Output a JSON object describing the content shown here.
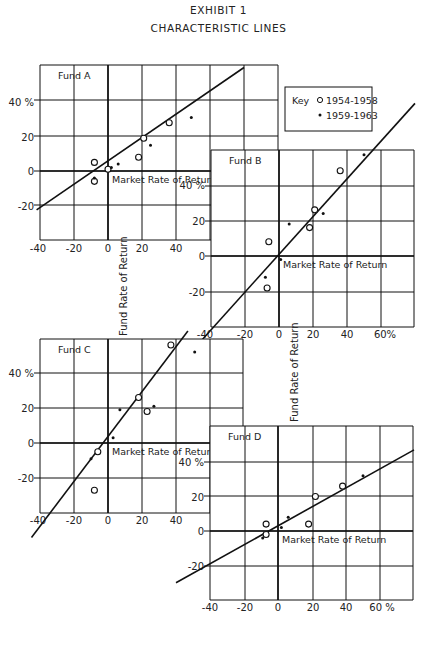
{
  "header": {
    "title": "EXHIBIT 1",
    "subtitle": "CHARACTERISTIC LINES"
  },
  "key": {
    "label": "Key",
    "entries": [
      {
        "marker": "open-circle",
        "label": "1954-1958"
      },
      {
        "marker": "dot",
        "label": "1959-1963"
      }
    ]
  },
  "axis_labels": {
    "x": "Market Rate of Return",
    "y": "Fund Rate of Return"
  },
  "colors": {
    "ink": "#111111",
    "paper": "#ffffff"
  },
  "chart_data": [
    {
      "type": "scatter",
      "title": "Fund A",
      "xlabel": "Market Rate of Return",
      "ylabel": "Fund Rate of Return",
      "xlim": [
        -40,
        80
      ],
      "ylim": [
        -40,
        60
      ],
      "x_ticks": [
        "-40",
        "-20",
        "0",
        "20",
        "40"
      ],
      "y_ticks": [
        "40 %",
        "20",
        "0",
        "-20"
      ],
      "grid": true,
      "fit_line": {
        "x": [
          -42,
          80
        ],
        "y": [
          -22.5,
          60
        ]
      },
      "series": [
        {
          "name": "1954-1958",
          "marker": "open-circle",
          "points": [
            [
              -8,
              5
            ],
            [
              -8,
              -6
            ],
            [
              0,
              1
            ],
            [
              18,
              8
            ],
            [
              21,
              19
            ],
            [
              36,
              28
            ]
          ]
        },
        {
          "name": "1959-1963",
          "marker": "dot",
          "points": [
            [
              -8,
              -4
            ],
            [
              2,
              2
            ],
            [
              6,
              4
            ],
            [
              25,
              15
            ],
            [
              49,
              31
            ]
          ]
        }
      ]
    },
    {
      "type": "scatter",
      "title": "Fund B",
      "xlabel": "Market Rate of Return",
      "ylabel": "Fund Rate of Return",
      "xlim": [
        -40,
        80
      ],
      "ylim": [
        -40,
        60
      ],
      "x_ticks": [
        "-40",
        "-20",
        "0",
        "20",
        "40",
        "60%"
      ],
      "y_ticks": [
        "40 %",
        "20",
        "0",
        "-20"
      ],
      "grid": true,
      "fit_line": {
        "x": [
          -46,
          80
        ],
        "y": [
          -48,
          86
        ]
      },
      "series": [
        {
          "name": "1954-1958",
          "marker": "open-circle",
          "points": [
            [
              -6,
              8
            ],
            [
              -7,
              -18
            ],
            [
              18,
              16
            ],
            [
              21,
              26
            ],
            [
              36,
              48
            ]
          ]
        },
        {
          "name": "1959-1963",
          "marker": "dot",
          "points": [
            [
              -8,
              -12
            ],
            [
              1,
              -2
            ],
            [
              6,
              18
            ],
            [
              26,
              24
            ],
            [
              50,
              57
            ]
          ]
        }
      ]
    },
    {
      "type": "scatter",
      "title": "Fund C",
      "xlabel": "Market Rate of Return",
      "ylabel": "Fund Rate of Return",
      "xlim": [
        -40,
        80
      ],
      "ylim": [
        -40,
        60
      ],
      "x_ticks": [
        "-40",
        "-20",
        "0",
        "20",
        "40"
      ],
      "y_ticks": [
        "40 %",
        "20",
        "0",
        "-20"
      ],
      "grid": true,
      "fit_line": {
        "x": [
          -45,
          47
        ],
        "y": [
          -54,
          64
        ]
      },
      "series": [
        {
          "name": "1954-1958",
          "marker": "open-circle",
          "points": [
            [
              -6,
              -5
            ],
            [
              -8,
              -27
            ],
            [
              18,
              26
            ],
            [
              23,
              18
            ],
            [
              37,
              56
            ]
          ]
        },
        {
          "name": "1959-1963",
          "marker": "dot",
          "points": [
            [
              -10,
              -9
            ],
            [
              3,
              3
            ],
            [
              7,
              19
            ],
            [
              27,
              21
            ],
            [
              51,
              52
            ]
          ]
        }
      ]
    },
    {
      "type": "scatter",
      "title": "Fund D",
      "xlabel": "Market Rate of Return",
      "ylabel": "Fund Rate of Return",
      "xlim": [
        -40,
        80
      ],
      "ylim": [
        -40,
        60
      ],
      "x_ticks": [
        "-40",
        "-20",
        "0",
        "20",
        "40",
        "60 %"
      ],
      "y_ticks": [
        "40 %",
        "20",
        "0",
        "-20"
      ],
      "grid": true,
      "fit_line": {
        "x": [
          -60,
          80
        ],
        "y": [
          -30,
          47
        ]
      },
      "series": [
        {
          "name": "1954-1958",
          "marker": "open-circle",
          "points": [
            [
              -7,
              4
            ],
            [
              -7,
              -2
            ],
            [
              18,
              4
            ],
            [
              22,
              20
            ],
            [
              38,
              26
            ]
          ]
        },
        {
          "name": "1959-1963",
          "marker": "dot",
          "points": [
            [
              -9,
              -4
            ],
            [
              2,
              2
            ],
            [
              6,
              8
            ],
            [
              50,
              32
            ]
          ]
        }
      ]
    }
  ]
}
